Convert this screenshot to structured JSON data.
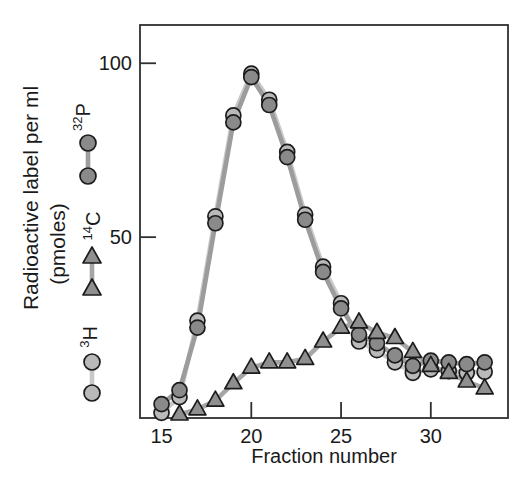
{
  "figure": {
    "ylabel_line1": "Radioactive label per ml",
    "ylabel_line2": "(pmoles)",
    "xlabel": "Fraction number"
  },
  "legend": [
    {
      "sup": "32",
      "base": "P",
      "marker": "circle",
      "fill": "#8a8a8a",
      "line": "#9c9c9c"
    },
    {
      "sup": "14",
      "base": "C",
      "marker": "triangle",
      "fill": "#8f8f8f",
      "line": "#a6a6a6"
    },
    {
      "sup": "3",
      "base": "H",
      "marker": "circle",
      "fill": "#b9b9b9",
      "line": "#c9c9c9"
    }
  ],
  "chart_data": {
    "type": "line",
    "title": "",
    "xlabel": "Fraction number",
    "ylabel": "Radioactive label per ml (pmoles)",
    "xlim": [
      13.8,
      34.3
    ],
    "ylim": [
      -2,
      111
    ],
    "xticks": [
      15,
      20,
      25,
      30
    ],
    "yticks": [
      50,
      100
    ],
    "grid": false,
    "legend_position": "left",
    "axis_color": "#2f2f2f",
    "series": [
      {
        "name": "32P",
        "marker": "circle",
        "marker_fill": "#8a8a8a",
        "marker_stroke": "#1c1c1c",
        "line_color": "#9c9c9c",
        "z": 1,
        "x": [
          15,
          16,
          17,
          18,
          19,
          20,
          21,
          22,
          23,
          24,
          25,
          26,
          27,
          28,
          29,
          30,
          31,
          32,
          33
        ],
        "y": [
          2,
          6,
          24,
          54,
          83,
          96,
          88,
          73,
          55,
          40,
          29.5,
          22,
          19.5,
          16,
          13,
          14.5,
          14,
          13.5,
          14
        ]
      },
      {
        "name": "14C",
        "marker": "triangle",
        "marker_fill": "#8f8f8f",
        "marker_stroke": "#1c1c1c",
        "line_color": "#a6a6a6",
        "z": 2,
        "x": [
          16,
          17,
          18,
          19,
          20,
          21,
          22,
          23,
          24,
          25,
          26,
          27,
          28,
          29,
          30,
          31,
          32,
          33
        ],
        "y": [
          -1,
          0.5,
          3,
          8,
          12.5,
          14,
          14,
          15,
          20,
          24,
          25.5,
          22.5,
          21,
          17,
          13,
          11,
          8.5,
          6.5
        ]
      },
      {
        "name": "3H",
        "marker": "circle",
        "marker_fill": "#b9b9b9",
        "marker_stroke": "#1c1c1c",
        "line_color": "#c9c9c9",
        "z": 0,
        "x": [
          15,
          16,
          17,
          18,
          19,
          20,
          21,
          22,
          23,
          24,
          25,
          26,
          27,
          28,
          29,
          30,
          31,
          32,
          33
        ],
        "y": [
          -0.5,
          4,
          26,
          56,
          85,
          97,
          89.5,
          74.5,
          56.5,
          41.5,
          31,
          20,
          17.5,
          14,
          11,
          12,
          11.5,
          11,
          11.3
        ]
      }
    ]
  }
}
